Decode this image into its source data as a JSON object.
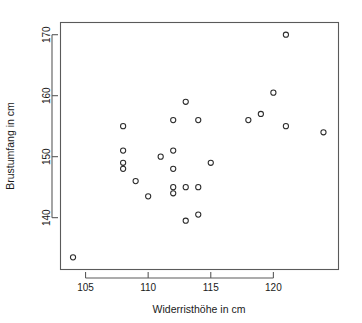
{
  "chart_data": {
    "type": "scatter",
    "title": "",
    "xlabel": "Widerristhöhe in cm",
    "ylabel": "Brustumfang in cm",
    "xlim": [
      103.0,
      125.2
    ],
    "ylim": [
      131.5,
      172.0
    ],
    "xticks": [
      105,
      110,
      115,
      120
    ],
    "xtick_labels": [
      "105",
      "110",
      "115",
      "120"
    ],
    "yticks": [
      140,
      150,
      160,
      170
    ],
    "ytick_labels": [
      "140",
      "150",
      "160",
      "170"
    ],
    "grid": false,
    "legend": null,
    "marker": "open-circle",
    "marker_color": "#2b2b2b",
    "n_points": 26,
    "x": [
      104,
      108,
      108,
      108,
      108,
      109,
      110,
      111,
      112,
      112,
      112,
      112,
      112,
      113,
      113,
      113,
      114,
      114,
      114,
      115,
      118,
      119,
      120,
      121,
      121,
      124
    ],
    "y": [
      133.5,
      155.0,
      151.0,
      149.0,
      148.0,
      146.0,
      143.5,
      150.0,
      156.0,
      151.0,
      148.0,
      145.0,
      144.0,
      159.0,
      145.0,
      139.5,
      156.0,
      145.0,
      140.5,
      149.0,
      156.0,
      157.0,
      160.5,
      170.0,
      155.0,
      154.0
    ],
    "points": [
      {
        "x": 104,
        "y": 133.5
      },
      {
        "x": 108,
        "y": 155.0
      },
      {
        "x": 108,
        "y": 151.0
      },
      {
        "x": 108,
        "y": 149.0
      },
      {
        "x": 108,
        "y": 148.0
      },
      {
        "x": 109,
        "y": 146.0
      },
      {
        "x": 110,
        "y": 143.5
      },
      {
        "x": 111,
        "y": 150.0
      },
      {
        "x": 112,
        "y": 156.0
      },
      {
        "x": 112,
        "y": 151.0
      },
      {
        "x": 112,
        "y": 148.0
      },
      {
        "x": 112,
        "y": 145.0
      },
      {
        "x": 112,
        "y": 144.0
      },
      {
        "x": 113,
        "y": 159.0
      },
      {
        "x": 113,
        "y": 145.0
      },
      {
        "x": 113,
        "y": 139.5
      },
      {
        "x": 114,
        "y": 156.0
      },
      {
        "x": 114,
        "y": 145.0
      },
      {
        "x": 114,
        "y": 140.5
      },
      {
        "x": 115,
        "y": 149.0
      },
      {
        "x": 118,
        "y": 156.0
      },
      {
        "x": 119,
        "y": 157.0
      },
      {
        "x": 120,
        "y": 160.5
      },
      {
        "x": 121,
        "y": 170.0
      },
      {
        "x": 121,
        "y": 155.0
      },
      {
        "x": 124,
        "y": 154.0
      }
    ]
  },
  "colors": {
    "axis": "#5a5a5a",
    "text": "#1a1a1a",
    "marker": "#2b2b2b",
    "background": "#ffffff"
  }
}
